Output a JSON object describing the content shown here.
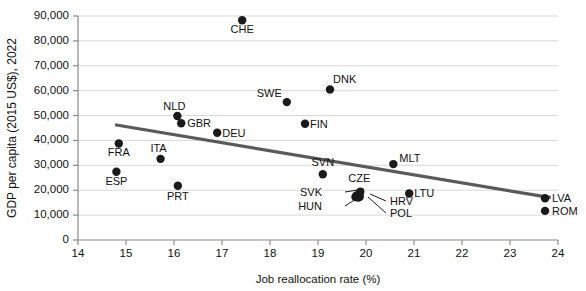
{
  "chart_data": {
    "type": "scatter",
    "title": "",
    "xlabel": "Job reallocation rate (%)",
    "ylabel": "GDP per capita (2015 US$), 2022",
    "xlim": [
      14,
      24
    ],
    "ylim": [
      0,
      90000
    ],
    "xticks": [
      "14",
      "15",
      "16",
      "17",
      "18",
      "19",
      "20",
      "21",
      "22",
      "23",
      "24"
    ],
    "yticks": [
      "0",
      "10,000",
      "20,000",
      "30,000",
      "40,000",
      "50,000",
      "60,000",
      "70,000",
      "80,000",
      "90,000"
    ],
    "grid": "horizontal",
    "legend": "none",
    "points": [
      {
        "label": "CHE",
        "x": 17.42,
        "y": 88300,
        "label_dx": 0,
        "label_dy": 13,
        "anchor": "middle"
      },
      {
        "label": "DNK",
        "x": 19.25,
        "y": 60500,
        "label_dx": 3,
        "label_dy": -6,
        "anchor": "start"
      },
      {
        "label": "SWE",
        "x": 18.35,
        "y": 55400,
        "label_dx": -5,
        "label_dy": -5,
        "anchor": "end"
      },
      {
        "label": "NLD",
        "x": 16.07,
        "y": 49800,
        "label_dx": -3,
        "label_dy": -6,
        "anchor": "middle"
      },
      {
        "label": "GBR",
        "x": 16.15,
        "y": 46900,
        "label_dx": 6,
        "label_dy": 4,
        "anchor": "start"
      },
      {
        "label": "FIN",
        "x": 18.73,
        "y": 46700,
        "label_dx": 5,
        "label_dy": 4,
        "anchor": "start"
      },
      {
        "label": "DEU",
        "x": 16.9,
        "y": 43100,
        "label_dx": 5,
        "label_dy": 4,
        "anchor": "start"
      },
      {
        "label": "FRA",
        "x": 14.85,
        "y": 38800,
        "label_dx": 0,
        "label_dy": 13,
        "anchor": "middle"
      },
      {
        "label": "ITA",
        "x": 15.72,
        "y": 32600,
        "label_dx": -2,
        "label_dy": -7,
        "anchor": "middle"
      },
      {
        "label": "MLT",
        "x": 20.57,
        "y": 30500,
        "label_dx": 6,
        "label_dy": -2,
        "anchor": "start"
      },
      {
        "label": "ESP",
        "x": 14.8,
        "y": 27400,
        "label_dx": 0,
        "label_dy": 13,
        "anchor": "middle"
      },
      {
        "label": "SVN",
        "x": 19.1,
        "y": 26400,
        "label_dx": 0,
        "label_dy": -8,
        "anchor": "middle"
      },
      {
        "label": "PRT",
        "x": 16.08,
        "y": 21800,
        "label_dx": 0,
        "label_dy": 14,
        "anchor": "middle"
      },
      {
        "label": "CZE",
        "x": 19.88,
        "y": 19400,
        "label_dx": -1,
        "label_dy": -10,
        "anchor": "middle"
      },
      {
        "label": "LTU",
        "x": 20.9,
        "y": 18700,
        "label_dx": 5,
        "label_dy": 4,
        "anchor": "start"
      },
      {
        "label": "LVA",
        "x": 23.73,
        "y": 16800,
        "label_dx": 7,
        "label_dy": 4,
        "anchor": "start"
      },
      {
        "label": "SVK",
        "x": 19.8,
        "y": 17900,
        "label_dx": 0,
        "label_dy": 0,
        "anchor": "end"
      },
      {
        "label": "HRV",
        "x": 19.87,
        "y": 17400,
        "label_dx": 0,
        "label_dy": 0,
        "anchor": "start"
      },
      {
        "label": "HUN",
        "x": 19.78,
        "y": 17300,
        "label_dx": 0,
        "label_dy": 0,
        "anchor": "end"
      },
      {
        "label": "POL",
        "x": 19.84,
        "y": 17100,
        "label_dx": 0,
        "label_dy": 0,
        "anchor": "start"
      },
      {
        "label": "ROM",
        "x": 23.73,
        "y": 11700,
        "label_dx": 7,
        "label_dy": 4,
        "anchor": "start"
      }
    ],
    "callout_labels": [
      {
        "label": "SVK",
        "text_x": 322,
        "text_y": 196,
        "line_x1": 345,
        "line_y1": 192,
        "line_x2": 364,
        "line_y2": 189
      },
      {
        "label": "HUN",
        "text_x": 322,
        "text_y": 210,
        "line_x1": 345,
        "line_y1": 206,
        "line_x2": 364,
        "line_y2": 194
      },
      {
        "label": "HRV",
        "text_x": 390,
        "text_y": 205,
        "line_x1": 386,
        "line_y1": 201,
        "line_x2": 370,
        "line_y2": 194
      },
      {
        "label": "POL",
        "text_x": 390,
        "text_y": 217,
        "line_x1": 386,
        "line_y1": 213,
        "line_x2": 368,
        "line_y2": 197
      }
    ],
    "trendline": {
      "x1": 14.77,
      "y1": 46300,
      "x2": 23.85,
      "y2": 17000,
      "color": "#5a5a5a"
    },
    "colors": {
      "point": "#1a1a1a",
      "trend": "#5a5a5a",
      "grid": "#d8d8d8",
      "axis": "#8a8a8a",
      "background": "#ffffff"
    }
  }
}
